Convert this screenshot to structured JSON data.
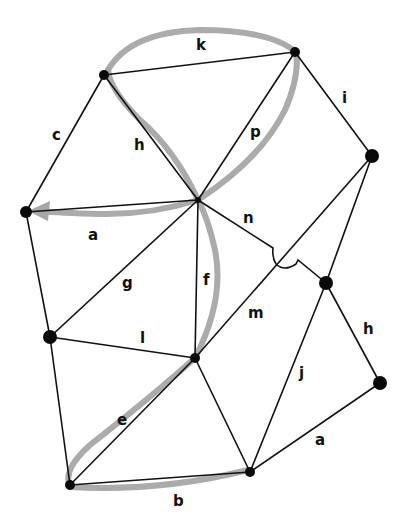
{
  "diagram": {
    "title": "",
    "colors": {
      "edge": "#111111",
      "node": "#0a0a0a",
      "highlight_path": "#a6a6a6",
      "background": "#ffffff"
    },
    "nodes": [
      {
        "id": "n_top_left",
        "x": 104,
        "y": 75
      },
      {
        "id": "n_top_right",
        "x": 295,
        "y": 52
      },
      {
        "id": "n_right",
        "x": 372,
        "y": 156
      },
      {
        "id": "n_left",
        "x": 26,
        "y": 212
      },
      {
        "id": "n_hub",
        "x": 198,
        "y": 200
      },
      {
        "id": "n_mid_right",
        "x": 326,
        "y": 283
      },
      {
        "id": "n_left_lower",
        "x": 50,
        "y": 337
      },
      {
        "id": "n_center_lower",
        "x": 195,
        "y": 358
      },
      {
        "id": "n_right_lower",
        "x": 380,
        "y": 383
      },
      {
        "id": "n_bottom_left",
        "x": 70,
        "y": 485
      },
      {
        "id": "n_bottom_center",
        "x": 250,
        "y": 472
      }
    ],
    "edge_labels": {
      "k": "k",
      "c": "c",
      "h_upper": "h",
      "p": "p",
      "i": "i",
      "a_upper": "a",
      "n": "n",
      "g": "g",
      "f": "f",
      "m": "m",
      "h_lower": "h",
      "l": "l",
      "j": "j",
      "e": "e",
      "a_lower": "a",
      "b": "b"
    },
    "highlighted_route": [
      "b",
      "e",
      "f",
      "p",
      "k",
      "h",
      "a"
    ]
  }
}
